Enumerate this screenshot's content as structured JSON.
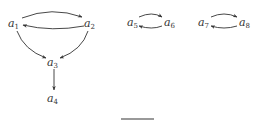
{
  "diagram": {
    "nodes": [
      {
        "id": "a1",
        "base": "a",
        "sub": "1",
        "x": 13,
        "y": 26
      },
      {
        "id": "a2",
        "base": "a",
        "sub": "2",
        "x": 89,
        "y": 26
      },
      {
        "id": "a3",
        "base": "a",
        "sub": "3",
        "x": 51,
        "y": 65
      },
      {
        "id": "a4",
        "base": "a",
        "sub": "4",
        "x": 51,
        "y": 101
      },
      {
        "id": "a5",
        "base": "a",
        "sub": "5",
        "x": 131,
        "y": 25
      },
      {
        "id": "a6",
        "base": "a",
        "sub": "6",
        "x": 171,
        "y": 25
      },
      {
        "id": "a7",
        "base": "a",
        "sub": "7",
        "x": 201,
        "y": 25
      },
      {
        "id": "a8",
        "base": "a",
        "sub": "8",
        "x": 242,
        "y": 25
      }
    ],
    "edges": [
      {
        "from": "a1",
        "to": "a2"
      },
      {
        "from": "a2",
        "to": "a1"
      },
      {
        "from": "a1",
        "to": "a3"
      },
      {
        "from": "a2",
        "to": "a3"
      },
      {
        "from": "a3",
        "to": "a4"
      },
      {
        "from": "a5",
        "to": "a6"
      },
      {
        "from": "a6",
        "to": "a5"
      },
      {
        "from": "a7",
        "to": "a8"
      },
      {
        "from": "a8",
        "to": "a7"
      }
    ],
    "caption": "(a) (cropped)"
  }
}
